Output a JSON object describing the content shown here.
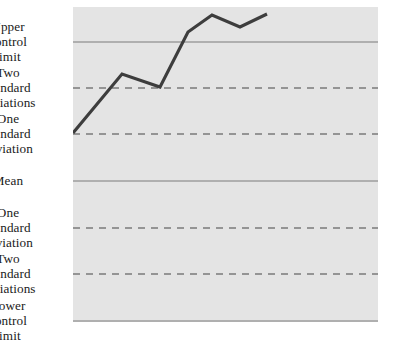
{
  "chart_data": {
    "type": "line",
    "title": "",
    "xlabel": "",
    "ylabel": "",
    "grid": true,
    "legend": "none",
    "plot_area": {
      "left": 73,
      "top": 7,
      "width": 305,
      "height": 315
    },
    "background_color": "#e4e4e4",
    "series_color": "#3d3d3d",
    "gridline_color": "#7a7a7a",
    "ylim": [
      -3.5,
      3.5
    ],
    "reference_lines": [
      {
        "id": "ucl",
        "label": "Upper\ncontrol\nlimit",
        "value": 3,
        "y": 42,
        "style": "solid"
      },
      {
        "id": "plus2sd",
        "label": "Two\nstandard\ndeviations",
        "value": 2,
        "y": 88,
        "style": "dashed"
      },
      {
        "id": "plus1sd",
        "label": "One\nstandard\ndeviation",
        "value": 1,
        "y": 134,
        "style": "dashed"
      },
      {
        "id": "mean",
        "label": "Mean",
        "value": 0,
        "y": 181,
        "style": "solid"
      },
      {
        "id": "min1sd",
        "label": "One\nstandard\ndeviation",
        "value": -1,
        "y": 228,
        "style": "dashed"
      },
      {
        "id": "min2sd",
        "label": "Two\nstandard\ndeviations",
        "value": -2,
        "y": 274,
        "style": "dashed"
      },
      {
        "id": "lcl",
        "label": "Lower\ncontrol\nlimit",
        "value": -3,
        "y": 321,
        "style": "solid"
      }
    ],
    "series": [
      {
        "name": "observation",
        "points": [
          {
            "x": 0,
            "y": 1.03,
            "px": 73,
            "py": 133
          },
          {
            "x": 1,
            "y": 2.29,
            "px": 122,
            "py": 74
          },
          {
            "x": 2,
            "y": 2.01,
            "px": 160,
            "py": 87
          },
          {
            "x": 3,
            "y": 3.18,
            "px": 188,
            "py": 32
          },
          {
            "x": 4,
            "y": 3.54,
            "px": 212,
            "py": 15
          },
          {
            "x": 5,
            "y": 3.29,
            "px": 240,
            "py": 27
          },
          {
            "x": 6,
            "y": 3.56,
            "px": 267,
            "py": 14
          }
        ]
      }
    ]
  },
  "labels": {
    "ucl": "Upper\ncontrol\nlimit",
    "plus2sd": "Two\nstandard\ndeviations",
    "plus1sd": "One\nstandard\ndeviation",
    "mean": "Mean",
    "min1sd": "One\nstandard\ndeviation",
    "min2sd": "Two\nstandard\ndeviations",
    "lcl": "Lower\ncontrol\nlimit"
  }
}
